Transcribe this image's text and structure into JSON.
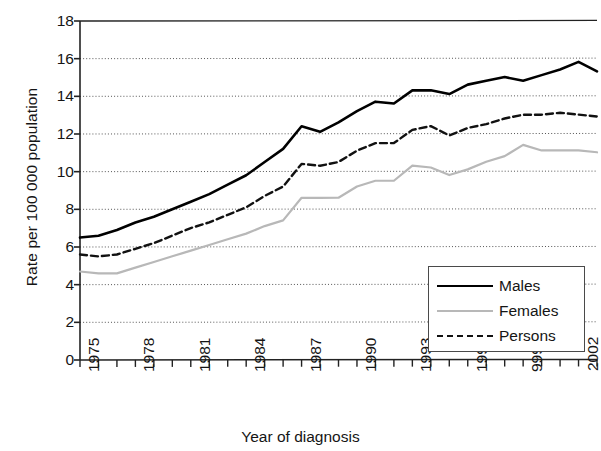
{
  "chart_data": {
    "type": "line",
    "title": "",
    "xlabel": "Year of diagnosis",
    "ylabel": "Rate per 100 000 population",
    "ylim": [
      0,
      18
    ],
    "ytick_labels": [
      "18",
      "16",
      "14",
      "12",
      "10",
      "8",
      "6",
      "4",
      "2",
      "0"
    ],
    "ytick_values": [
      18,
      16,
      14,
      12,
      10,
      8,
      6,
      4,
      2,
      0
    ],
    "xlim": [
      1975,
      2003
    ],
    "xtick_labels": [
      "1975",
      "1978",
      "1981",
      "1984",
      "1987",
      "1990",
      "1993",
      "1996",
      "999",
      "2002"
    ],
    "xtick_values": [
      1975,
      1978,
      1981,
      1984,
      1987,
      1990,
      1993,
      1996,
      1999,
      2002
    ],
    "grid": "horizontal-dotted",
    "legend_position": "lower-right-inside",
    "x": [
      1975,
      1976,
      1977,
      1978,
      1979,
      1980,
      1981,
      1982,
      1983,
      1984,
      1985,
      1986,
      1987,
      1988,
      1989,
      1990,
      1991,
      1992,
      1993,
      1994,
      1995,
      1996,
      1997,
      1998,
      1999,
      2000,
      2001,
      2002,
      2003
    ],
    "series": [
      {
        "name": "Males",
        "color": "#000000",
        "style": "solid",
        "width": 2.6,
        "values": [
          6.5,
          6.6,
          6.9,
          7.3,
          7.6,
          8.0,
          8.4,
          8.8,
          9.3,
          9.8,
          10.5,
          11.2,
          12.4,
          12.1,
          12.6,
          13.2,
          13.7,
          13.6,
          14.3,
          14.3,
          14.1,
          14.6,
          14.8,
          15.0,
          14.8,
          15.1,
          15.4,
          15.8,
          15.3
        ]
      },
      {
        "name": "Females",
        "color": "#b8b8b8",
        "style": "solid",
        "width": 2.2,
        "values": [
          4.7,
          4.6,
          4.6,
          4.9,
          5.2,
          5.5,
          5.8,
          6.1,
          6.4,
          6.7,
          7.1,
          7.4,
          8.6,
          8.6,
          8.6,
          9.2,
          9.5,
          9.5,
          10.3,
          10.2,
          9.8,
          10.1,
          10.5,
          10.8,
          11.4,
          11.1,
          11.1,
          11.1,
          11.0
        ]
      },
      {
        "name": "Persons",
        "color": "#111111",
        "style": "dashed",
        "width": 2.4,
        "values": [
          5.6,
          5.5,
          5.6,
          5.9,
          6.2,
          6.6,
          7.0,
          7.3,
          7.7,
          8.1,
          8.7,
          9.2,
          10.4,
          10.3,
          10.5,
          11.1,
          11.5,
          11.5,
          12.2,
          12.4,
          11.9,
          12.3,
          12.5,
          12.8,
          13.0,
          13.0,
          13.1,
          13.0,
          12.9
        ]
      }
    ]
  },
  "legend": {
    "items": [
      {
        "label": "Males"
      },
      {
        "label": "Females"
      },
      {
        "label": "Persons"
      }
    ]
  }
}
